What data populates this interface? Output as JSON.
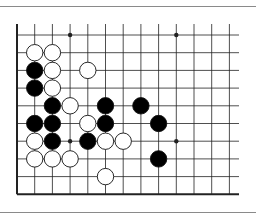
{
  "diagram": {
    "type": "go-board-fragment",
    "colors": {
      "line": "#222222",
      "black_stone": "#000000",
      "white_stone": "#ffffff",
      "stone_outline": "#111111"
    },
    "grid": {
      "origin_x": 17,
      "origin_y": 35,
      "spacing": 17.7,
      "cols": 13,
      "rows": 10,
      "line_right_x": 239,
      "line_top_extend_y": 24,
      "edges": [
        "left",
        "bottom"
      ]
    },
    "star_points": [
      [
        3,
        0
      ],
      [
        9,
        0
      ],
      [
        3,
        6
      ],
      [
        9,
        6
      ]
    ],
    "stones": [
      {
        "color": "white",
        "col": 1,
        "row": 1
      },
      {
        "color": "white",
        "col": 2,
        "row": 1
      },
      {
        "color": "black",
        "col": 1,
        "row": 2
      },
      {
        "color": "white",
        "col": 2,
        "row": 2
      },
      {
        "color": "white",
        "col": 4,
        "row": 2
      },
      {
        "color": "black",
        "col": 1,
        "row": 3
      },
      {
        "color": "white",
        "col": 2,
        "row": 3
      },
      {
        "color": "black",
        "col": 2,
        "row": 4
      },
      {
        "color": "white",
        "col": 3,
        "row": 4
      },
      {
        "color": "black",
        "col": 5,
        "row": 4
      },
      {
        "color": "black",
        "col": 7,
        "row": 4
      },
      {
        "color": "black",
        "col": 1,
        "row": 5
      },
      {
        "color": "black",
        "col": 2,
        "row": 5
      },
      {
        "color": "white",
        "col": 4,
        "row": 5
      },
      {
        "color": "black",
        "col": 5,
        "row": 5
      },
      {
        "color": "black",
        "col": 8,
        "row": 5
      },
      {
        "color": "white",
        "col": 1,
        "row": 6
      },
      {
        "color": "black",
        "col": 2,
        "row": 6
      },
      {
        "color": "black",
        "col": 4,
        "row": 6
      },
      {
        "color": "white",
        "col": 5,
        "row": 6
      },
      {
        "color": "white",
        "col": 6,
        "row": 6
      },
      {
        "color": "white",
        "col": 1,
        "row": 7
      },
      {
        "color": "white",
        "col": 2,
        "row": 7
      },
      {
        "color": "white",
        "col": 3,
        "row": 7
      },
      {
        "color": "black",
        "col": 8,
        "row": 7
      },
      {
        "color": "white",
        "col": 5,
        "row": 8
      }
    ]
  }
}
